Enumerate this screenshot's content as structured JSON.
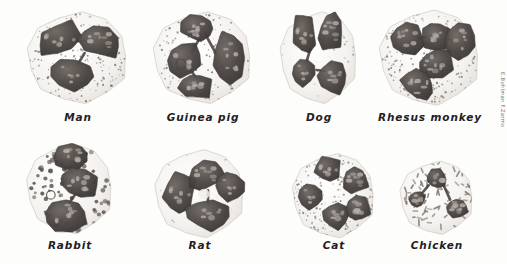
{
  "plate": {
    "title": "Comparative morphology of granulocytes (neutrophils / heterophils)",
    "background_color": "#fdfdfc",
    "ink_color": "#23201e",
    "nucleus_dark": "#4a4542",
    "nucleus_mid": "#6e6762",
    "nucleus_light": "#b9b2ac",
    "cytoplasm_color": "#f4f2ef",
    "granule_color": "#6b6560",
    "signature": "E.Bohlman F.Zarmo",
    "rows": 2,
    "columns": 4
  },
  "figures": [
    {
      "id": "man",
      "label": "Man",
      "row": 0,
      "col": 0,
      "x": 22,
      "y": 8,
      "w": 112,
      "h": 100,
      "label_x": 22,
      "label_y": 111,
      "label_w": 112,
      "cell_shape": "lobulated-round",
      "cytoplasm": "fine-stipple",
      "nucleus_lobes": 3,
      "granule_style": "fine dust-like stipple",
      "granule_count": 210
    },
    {
      "id": "guinea-pig",
      "label": "Guinea pig",
      "row": 0,
      "col": 1,
      "x": 148,
      "y": 8,
      "w": 110,
      "h": 100,
      "label_x": 142,
      "label_y": 111,
      "label_w": 122,
      "cell_shape": "irregular-round",
      "cytoplasm": "coarse-stipple",
      "nucleus_lobes": 4,
      "granule_style": "medium scattered dots",
      "granule_count": 150
    },
    {
      "id": "dog",
      "label": "Dog",
      "row": 0,
      "col": 2,
      "x": 276,
      "y": 8,
      "w": 86,
      "h": 100,
      "label_x": 276,
      "label_y": 111,
      "label_w": 86,
      "cell_shape": "oval-pale",
      "cytoplasm": "clear-pale",
      "nucleus_lobes": 4,
      "granule_style": "almost agranular, very pale",
      "granule_count": 26
    },
    {
      "id": "rhesus-monkey",
      "label": "Rhesus monkey",
      "row": 0,
      "col": 3,
      "x": 374,
      "y": 6,
      "w": 112,
      "h": 104,
      "label_x": 366,
      "label_y": 111,
      "label_w": 128,
      "cell_shape": "broad-round",
      "cytoplasm": "dense-stipple",
      "nucleus_lobes": 5,
      "granule_style": "dense fine stipple",
      "granule_count": 260
    },
    {
      "id": "rabbit",
      "label": "Rabbit",
      "row": 1,
      "col": 0,
      "x": 22,
      "y": 140,
      "w": 96,
      "h": 98,
      "label_x": 18,
      "label_y": 239,
      "label_w": 104,
      "cell_shape": "tall-oval",
      "cytoplasm": "coarse-granular",
      "nucleus_lobes": 3,
      "granule_style": "coarse discrete round granules",
      "granule_count": 82
    },
    {
      "id": "rat",
      "label": "Rat",
      "row": 1,
      "col": 1,
      "x": 150,
      "y": 146,
      "w": 100,
      "h": 96,
      "label_x": 150,
      "label_y": 239,
      "label_w": 100,
      "cell_shape": "polygonal-pale",
      "cytoplasm": "clear-pale",
      "nucleus_lobes": 1,
      "granule_style": "agranular pale cytoplasm, ring-form nucleus",
      "granule_count": 14
    },
    {
      "id": "cat",
      "label": "Cat",
      "row": 1,
      "col": 2,
      "x": 288,
      "y": 150,
      "w": 92,
      "h": 92,
      "label_x": 288,
      "label_y": 239,
      "label_w": 92,
      "cell_shape": "round",
      "cytoplasm": "fine-stipple",
      "nucleus_lobes": 5,
      "granule_style": "fine even stipple",
      "granule_count": 230
    },
    {
      "id": "chicken",
      "label": "Chicken",
      "row": 1,
      "col": 3,
      "x": 396,
      "y": 158,
      "w": 82,
      "h": 80,
      "label_x": 390,
      "label_y": 239,
      "label_w": 94,
      "cell_shape": "round",
      "cytoplasm": "rod-granules",
      "nucleus_lobes": 2,
      "granule_style": "spindle / rod-shaped eosinophilic granules",
      "granule_count": 70
    }
  ]
}
